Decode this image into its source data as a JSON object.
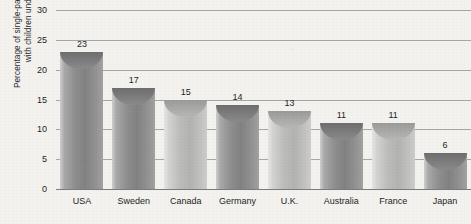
{
  "chart_data": {
    "type": "bar",
    "title": "",
    "xlabel": "",
    "ylabel": "Percentage of single-parent families\nwith children under 18",
    "ylim": [
      0,
      30
    ],
    "ytick_labels": [
      "30",
      "25",
      "20",
      "15",
      "10",
      "5",
      "0"
    ],
    "ytick_values": [
      30,
      25,
      20,
      15,
      10,
      5,
      0
    ],
    "grid": true,
    "legend": "none",
    "categories": [
      "USA",
      "Sweden",
      "Canada",
      "Germany",
      "U.K.",
      "Australia",
      "France",
      "Japan"
    ],
    "values": [
      23,
      17,
      15,
      14,
      13,
      11,
      11,
      6
    ],
    "value_labels": [
      "23",
      "17",
      "15",
      "14",
      "13",
      "11",
      "11",
      "6"
    ],
    "bar_tones": [
      "dark",
      "dark",
      "light",
      "dark",
      "light",
      "dark",
      "light",
      "dark"
    ],
    "colors": {
      "bar_dark": "#8f8f8f",
      "bar_light": "#bcbcba",
      "cap_dark": "#7b7b7b",
      "cap_light": "#a8a8a6",
      "gridline": "#8e8e8e",
      "background": "#f3f2ef",
      "text": "#1f1f1f"
    }
  }
}
